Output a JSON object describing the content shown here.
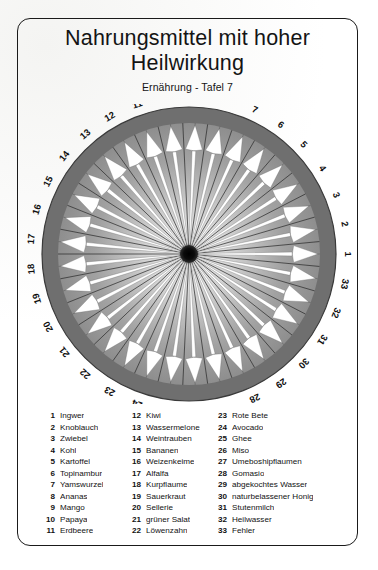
{
  "page": {
    "title_lines": [
      "Nahrungsmittel mit hoher",
      "Heilwirkung"
    ],
    "subtitle": "Ernährung - Tafel 7"
  },
  "chart_data": {
    "type": "radial-arrow-wheel",
    "title": "Nahrungsmittel mit hoher Heilwirkung",
    "subtitle": "Ernährung - Tafel 7",
    "segment_count": 33,
    "start_angle_deg": 0,
    "direction": "counterclockwise",
    "center": [
      189,
      254
    ],
    "outer_radius": 147,
    "ring_inner_radius": 131,
    "hub_radius": 9,
    "arrow_style": "white outward-pointing arrows on gray gradient disc",
    "disc_fill_center": "#f2f2f2",
    "disc_fill_edge": "#8c8c8c",
    "ring_fill": "#6f6f6f",
    "arrow_fill": "#ffffff",
    "ray_color": "#2a2a2a",
    "hub_color": "#0a0a0a",
    "tick_labels": [
      "1",
      "2",
      "3",
      "4",
      "5",
      "6",
      "7",
      "8",
      "9",
      "10",
      "11",
      "12",
      "13",
      "14",
      "15",
      "16",
      "17",
      "18",
      "19",
      "20",
      "21",
      "22",
      "23",
      "24",
      "25",
      "26",
      "27",
      "28",
      "29",
      "30",
      "31",
      "32",
      "33"
    ],
    "values": [
      1,
      1,
      1,
      1,
      1,
      1,
      1,
      1,
      1,
      1,
      1,
      1,
      1,
      1,
      1,
      1,
      1,
      1,
      1,
      1,
      1,
      1,
      1,
      1,
      1,
      1,
      1,
      1,
      1,
      1,
      1,
      1,
      1
    ],
    "note": "All 33 segments are equal-length radial arrows pointing outward from the central hub"
  },
  "legend": {
    "columns": [
      {
        "items": [
          {
            "num": "1",
            "label": "Ingwer"
          },
          {
            "num": "2",
            "label": "Knoblauch"
          },
          {
            "num": "3",
            "label": "Zwiebel"
          },
          {
            "num": "4",
            "label": "Kohl"
          },
          {
            "num": "5",
            "label": "Kartoffel"
          },
          {
            "num": "6",
            "label": "Topinambur"
          },
          {
            "num": "7",
            "label": "Yamswurzel"
          },
          {
            "num": "8",
            "label": "Ananas"
          },
          {
            "num": "9",
            "label": "Mango"
          },
          {
            "num": "10",
            "label": "Papaya"
          },
          {
            "num": "11",
            "label": "Erdbeere"
          }
        ]
      },
      {
        "items": [
          {
            "num": "12",
            "label": "Kiwi"
          },
          {
            "num": "13",
            "label": "Wassermelone"
          },
          {
            "num": "14",
            "label": "Weintrauben"
          },
          {
            "num": "15",
            "label": "Bananen"
          },
          {
            "num": "16",
            "label": "Weizenkeime"
          },
          {
            "num": "17",
            "label": "Alfalfa"
          },
          {
            "num": "18",
            "label": "Kurpflaume"
          },
          {
            "num": "19",
            "label": "Sauerkraut"
          },
          {
            "num": "20",
            "label": "Sellerie"
          },
          {
            "num": "21",
            "label": "grüner Salat"
          },
          {
            "num": "22",
            "label": "Löwenzahn"
          }
        ]
      },
      {
        "items": [
          {
            "num": "23",
            "label": "Rote Bete"
          },
          {
            "num": "24",
            "label": "Avocado"
          },
          {
            "num": "25",
            "label": "Ghee"
          },
          {
            "num": "26",
            "label": "Miso"
          },
          {
            "num": "27",
            "label": "Umeboshipflaumen"
          },
          {
            "num": "28",
            "label": "Gomasio"
          },
          {
            "num": "29",
            "label": "abgekochtes Wasser"
          },
          {
            "num": "30",
            "label": "naturbelassener Honig"
          },
          {
            "num": "31",
            "label": "Stutenmilch"
          },
          {
            "num": "32",
            "label": "Heilwasser"
          },
          {
            "num": "33",
            "label": "Fehler"
          }
        ]
      }
    ]
  }
}
